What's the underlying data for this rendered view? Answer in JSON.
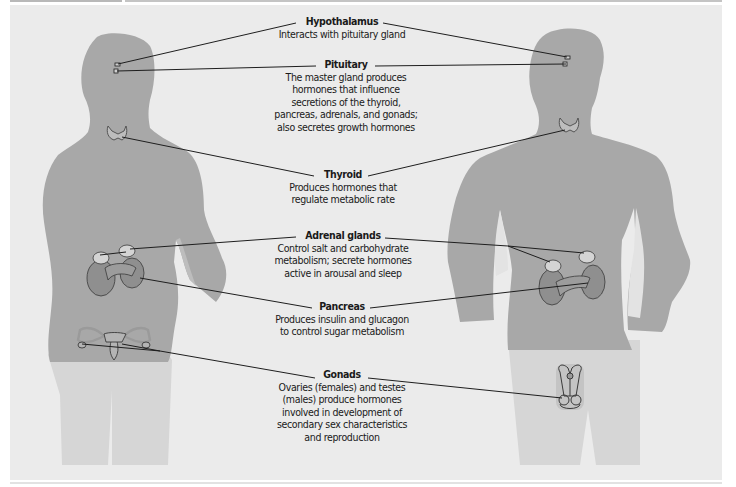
{
  "figure": {
    "colors": {
      "background": "#ebebeb",
      "silhouette": "#a8a8a8",
      "silhouette_lower": "#d6d6d6",
      "organ_fill": "#8f8f8f",
      "line": "#1e1e1e"
    },
    "glands": [
      {
        "id": "hypothalamus",
        "title": "Hypothalamus",
        "description": "Interacts with pituitary gland"
      },
      {
        "id": "pituitary",
        "title": "Pituitary",
        "description": "The master gland produces hormones that influence secretions of the thyroid, pancreas, adrenals, and gonads; also secretes growth hormones"
      },
      {
        "id": "thyroid",
        "title": "Thyroid",
        "description": "Produces hormones that regulate metabolic rate"
      },
      {
        "id": "adrenal",
        "title": "Adrenal glands",
        "description": "Control salt and carbohydrate metabolism; secrete hormones active in arousal and sleep"
      },
      {
        "id": "pancreas",
        "title": "Pancreas",
        "description": "Produces insulin and glucagon to control sugar metabolism"
      },
      {
        "id": "gonads",
        "title": "Gonads",
        "description": "Ovaries (females) and testes (males) produce hormones involved in development of secondary sex characteristics and reproduction"
      }
    ],
    "figures": [
      {
        "id": "female",
        "side": "left"
      },
      {
        "id": "male",
        "side": "right"
      }
    ]
  }
}
